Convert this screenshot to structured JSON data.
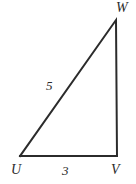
{
  "figure": {
    "type": "right-triangle-diagram",
    "background_color": "#ffffff",
    "stroke_color": "#2b2b2b",
    "label_color": "#2b2b2b",
    "stroke_width": 2,
    "vertices": {
      "U": {
        "label": "U",
        "x": 20,
        "y": 156
      },
      "V": {
        "label": "V",
        "x": 117,
        "y": 156
      },
      "W": {
        "label": "W",
        "x": 116,
        "y": 20
      }
    },
    "sides": [
      {
        "name": "UV",
        "label": "3",
        "value": 3,
        "position": "bottom"
      },
      {
        "name": "UW",
        "label": "5",
        "value": 5,
        "position": "hypotenuse"
      },
      {
        "name": "VW",
        "label": "",
        "value": null,
        "position": "right"
      }
    ],
    "labels": {
      "vertex_w": "W",
      "vertex_u": "U",
      "vertex_v": "V",
      "side_hypotenuse": "5",
      "side_base": "3"
    }
  }
}
